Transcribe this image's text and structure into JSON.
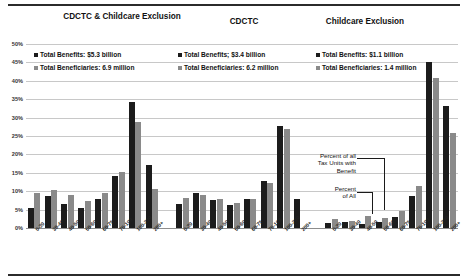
{
  "chart_data": {
    "type": "bar",
    "title": "",
    "xlabel": "",
    "ylabel": "",
    "ylim": [
      0,
      50
    ],
    "ytick_suffix": "%",
    "yticks": [
      "0%",
      "5%",
      "10%",
      "15%",
      "20%",
      "25%",
      "30%",
      "35%",
      "40%",
      "45%",
      "50%"
    ],
    "grid": true,
    "legend_position": "top",
    "categories": [
      "0-30",
      "30-40",
      "40-50",
      "50-60",
      "60-75",
      "75-100",
      "100-200",
      "200+"
    ],
    "series": [
      {
        "name": "Percent of all Tax Units with Benefit",
        "color": "#1c1c1c"
      },
      {
        "name": "Percent of All",
        "color": "#8a8a8a"
      }
    ],
    "groups": [
      {
        "title": "CDCTC & Childcare Exclusion",
        "total_benefits": "Total Benefits: $5.3 billion",
        "total_beneficiaries": "Total Beneficiaries: 6.9 million",
        "values_benefit": [
          5.4,
          8.8,
          6.6,
          5.4,
          7.8,
          14.2,
          34.2,
          17.1
        ],
        "values_all": [
          9.4,
          10.2,
          8.9,
          7.3,
          9.4,
          15.1,
          28.8,
          10.7
        ]
      },
      {
        "title": "CDCTC",
        "total_benefits": "Total Benefits; $3.4 billion",
        "total_beneficiaries": "Total Beneficiaries: 6.2 million",
        "values_benefit": [
          6.6,
          9.6,
          7.7,
          6.3,
          7.9,
          12.9,
          27.8,
          7.8
        ],
        "values_all": [
          8.1,
          8.9,
          7.8,
          6.9,
          7.9,
          12.3,
          26.9,
          0
        ]
      },
      {
        "title": "Childcare Exclusion",
        "total_benefits": "Total Benefits: $1.1 billion",
        "total_beneficiaries": "Total Beneficiaries: 1.4 million",
        "values_benefit": [
          1.4,
          1.7,
          1.2,
          1.7,
          3.0,
          8.6,
          45.2,
          33.1
        ],
        "values_all": [
          2.4,
          2.0,
          3.2,
          2.8,
          4.7,
          11.4,
          40.9,
          25.9
        ]
      }
    ],
    "annotations": [
      "Percent of all\nTax Units with\nBenefit",
      "Percent\nof All"
    ]
  }
}
